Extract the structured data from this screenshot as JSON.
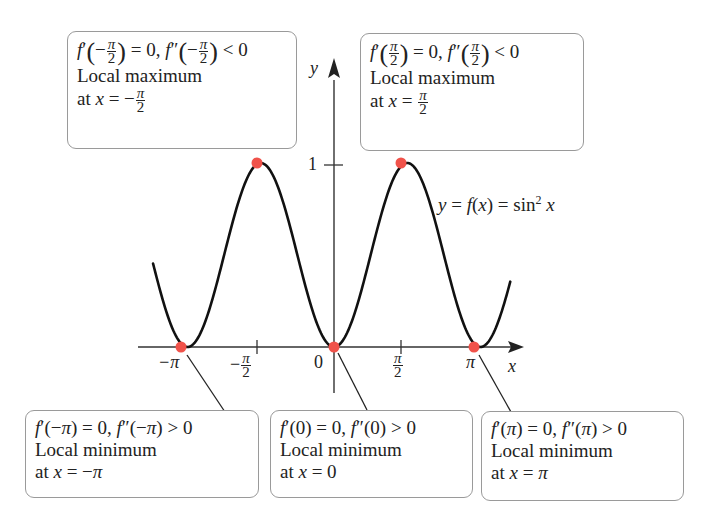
{
  "figure": {
    "curve_label": "y = f(x) = sin² x",
    "axes": {
      "x_label": "x",
      "y_label": "y",
      "y_tick_label": "1",
      "origin_label": "0",
      "x_tick_labels": [
        "−π",
        "−π/2",
        "0",
        "π/2",
        "π"
      ]
    },
    "colors": {
      "curve": "#111111",
      "axis": "#333333",
      "point": "#f0524a",
      "box_border": "#9a9a9a"
    }
  },
  "callouts": {
    "max_left": {
      "derivative": "f′(−π/2) = 0, f″(−π/2) < 0",
      "kind": "Local maximum",
      "location_prefix": "at",
      "location": "x = −π/2"
    },
    "max_right": {
      "derivative": "f′(π/2) = 0, f″(π/2) < 0",
      "kind": "Local maximum",
      "location_prefix": "at",
      "location": "x = π/2"
    },
    "min_left": {
      "derivative": "f′(−π) = 0, f″(−π) > 0",
      "kind": "Local minimum",
      "location": "at x = −π"
    },
    "min_center": {
      "derivative": "f′(0) = 0, f″(0) > 0",
      "kind": "Local minimum",
      "location": "at x = 0"
    },
    "min_right": {
      "derivative": "f′(π) = 0, f″(π) > 0",
      "kind": "Local minimum",
      "location": "at x = π"
    }
  },
  "chart_data": {
    "type": "line",
    "title": "",
    "function": "sin^2(x)",
    "xlabel": "x",
    "ylabel": "y",
    "x_range": [
      -3.88,
      3.78
    ],
    "ylim": [
      0,
      1
    ],
    "x_ticks": [
      -3.1416,
      -1.5708,
      0,
      1.5708,
      3.1416
    ],
    "x_tick_labels": [
      "−π",
      "−π/2",
      "0",
      "π/2",
      "π"
    ],
    "y_ticks": [
      1
    ],
    "y_tick_labels": [
      "1"
    ],
    "critical_points": [
      {
        "x": -3.1416,
        "y": 0,
        "type": "local minimum"
      },
      {
        "x": -1.5708,
        "y": 1,
        "type": "local maximum"
      },
      {
        "x": 0,
        "y": 0,
        "type": "local minimum"
      },
      {
        "x": 1.5708,
        "y": 1,
        "type": "local maximum"
      },
      {
        "x": 3.1416,
        "y": 0,
        "type": "local minimum"
      }
    ]
  }
}
